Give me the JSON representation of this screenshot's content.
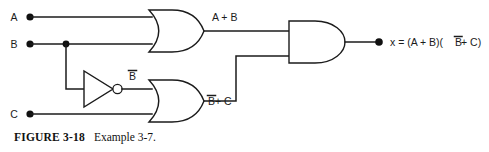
{
  "figure": {
    "caption_number": "FIGURE 3-18",
    "caption_text": "Example 3-7.",
    "background_color": "#ffffff",
    "line_color": "#1b1b1b"
  },
  "inputs": [
    {
      "name": "input-a",
      "label": "A",
      "x": 22,
      "y": 17
    },
    {
      "name": "input-b",
      "label": "B",
      "x": 22,
      "y": 44
    },
    {
      "name": "input-c",
      "label": "C",
      "x": 22,
      "y": 114
    }
  ],
  "gates": [
    {
      "name": "or-gate-1",
      "type": "OR",
      "output_label": "A + B"
    },
    {
      "name": "not-gate",
      "type": "NOT",
      "output_label": "B",
      "output_overbar": true
    },
    {
      "name": "or-gate-2",
      "type": "OR",
      "output_label": "B + C",
      "output_overbar_first": true
    },
    {
      "name": "and-gate",
      "type": "AND",
      "output_label": "x"
    }
  ],
  "wire_labels": {
    "or1_out": "A + B",
    "not_out": "B",
    "or2_out_prefix": "B",
    "or2_out_suffix": " + C"
  },
  "output": {
    "name": "circuit-output",
    "expression_lead": "x = (A + B)(",
    "expression_bar": "B",
    "expression_tail": " + C)"
  }
}
